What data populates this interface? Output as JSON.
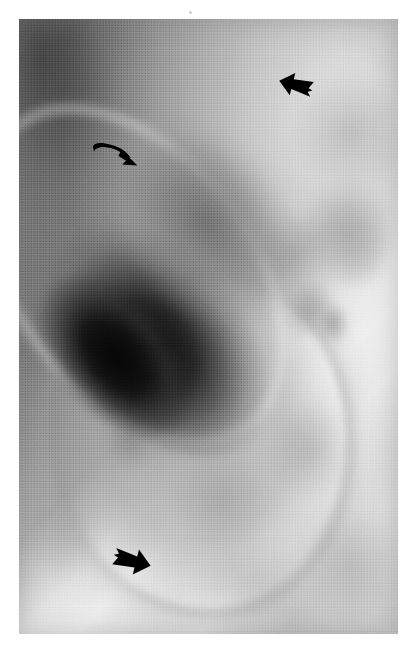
{
  "figure": {
    "kind": "radiograph",
    "modality_note": "grayscale plain film, halftone printed reproduction",
    "plate": {
      "left": 19,
      "top": 19,
      "width": 379,
      "height": 615,
      "background_color": "#8f8f8f",
      "page_color": "#ffffff"
    },
    "tones": {
      "page_white": "#ffffff",
      "film_light": "#c6c6c6",
      "film_mid": "#a8a8a8",
      "film_dark": "#5a5a5a",
      "gas_black": "#0a0a0a",
      "annotation_black": "#000000"
    }
  },
  "structures": [
    {
      "id": "gas-collection",
      "label": "elongated gas-filled viscus",
      "description": "large ovoid lucency oriented from upper-right to lower-left, densest black at its lower-left end",
      "tone": "#0a0a0a"
    },
    {
      "id": "soft-tissue-mass",
      "label": "rounded soft-tissue mass",
      "description": "large rounded opacity occupying the lower and central field with a faintly denser margin",
      "tone": "#aaaaaa"
    },
    {
      "id": "lucent-band",
      "label": "lucent fascial band",
      "description": "bright diagonal stripe along the upper-right margin of the film",
      "tone": "#f3f3f3"
    },
    {
      "id": "mottled-bowel",
      "label": "mottled bowel gas pattern",
      "description": "scattered irregular gray blobs across the right and lower field",
      "tone": "#909090"
    }
  ],
  "annotations": [
    {
      "id": "arrow-top-right",
      "glyph": "solid-block-arrow-icon",
      "direction": "down-left",
      "x": 278,
      "y": 70,
      "width": 36,
      "height": 30,
      "color": "#000000",
      "points_at": "superior margin of the mass"
    },
    {
      "id": "arrow-left-curved",
      "glyph": "curved-arrow-icon",
      "direction": "right-down",
      "x": 92,
      "y": 138,
      "width": 52,
      "height": 40,
      "color": "#000000",
      "points_at": "upper-left border of the gas collection"
    },
    {
      "id": "arrow-bottom-left",
      "glyph": "solid-block-arrow-icon",
      "direction": "up-right",
      "x": 112,
      "y": 545,
      "width": 40,
      "height": 32,
      "color": "#000000",
      "points_at": "inferior margin of the mass"
    }
  ],
  "marks": [
    {
      "id": "dust-speck",
      "x": 189,
      "y": 11,
      "size": 3,
      "color": "#cfcfcf"
    }
  ],
  "blobs": [
    {
      "id": "blob-right-upper",
      "left": "72%",
      "top": "8%",
      "w": "30%",
      "h": "20%",
      "tone": "rgba(128,128,128,.40)"
    },
    {
      "id": "blob-right-mid",
      "left": "74%",
      "top": "26%",
      "w": "26%",
      "h": "18%",
      "tone": "rgba(118,118,118,.45)"
    },
    {
      "id": "blob-right-loop",
      "left": "82%",
      "top": "30%",
      "w": "16%",
      "h": "14%",
      "tone": "rgba(176,176,176,.55)"
    },
    {
      "id": "blob-center-right",
      "left": "62%",
      "top": "31%",
      "w": "20%",
      "h": "14%",
      "tone": "rgba(124,124,124,.38)"
    },
    {
      "id": "blob-mid-right2",
      "left": "70%",
      "top": "42%",
      "w": "14%",
      "h": "10%",
      "tone": "rgba(112,112,112,.45)"
    },
    {
      "id": "blob-nodule",
      "left": "79%",
      "top": "46%",
      "w": "8%",
      "h": "7%",
      "tone": "rgba(104,104,104,.55)"
    },
    {
      "id": "blob-mass-core",
      "left": "26%",
      "top": "58%",
      "w": "20%",
      "h": "14%",
      "tone": "rgba(132,132,132,.45)"
    },
    {
      "id": "blob-mass-core2",
      "left": "23%",
      "top": "64%",
      "w": "12%",
      "h": "9%",
      "tone": "rgba(120,120,120,.50)"
    },
    {
      "id": "blob-mass-low",
      "left": "40%",
      "top": "70%",
      "w": "26%",
      "h": "16%",
      "tone": "rgba(138,138,138,.38)"
    },
    {
      "id": "blob-lower-right",
      "left": "66%",
      "top": "62%",
      "w": "22%",
      "h": "16%",
      "tone": "rgba(134,134,134,.35)"
    },
    {
      "id": "blob-bottom",
      "left": "46%",
      "top": "84%",
      "w": "28%",
      "h": "14%",
      "tone": "rgba(150,150,150,.30)"
    },
    {
      "id": "blob-bottom-right",
      "left": "76%",
      "top": "80%",
      "w": "24%",
      "h": "18%",
      "tone": "rgba(142,142,142,.32)"
    },
    {
      "id": "blob-left-low",
      "left": "2%",
      "top": "74%",
      "w": "20%",
      "h": "18%",
      "tone": "rgba(140,140,140,.30)"
    },
    {
      "id": "blob-topleft-dark",
      "left": "0%",
      "top": "0%",
      "w": "26%",
      "h": "26%",
      "tone": "rgba(70,70,70,.40)"
    }
  ]
}
